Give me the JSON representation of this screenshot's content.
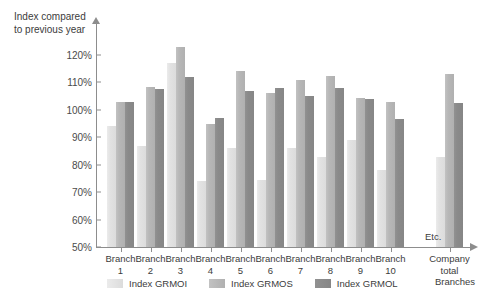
{
  "chart_data": {
    "type": "bar",
    "title": "Index compared to previous year",
    "xlabel": "Branches",
    "ylabel": "Index compared to previous year",
    "ylim": [
      50,
      125
    ],
    "yticks": [
      50,
      60,
      70,
      80,
      90,
      100,
      110,
      120
    ],
    "ytick_labels": [
      "50%",
      "60%",
      "70%",
      "80%",
      "90%",
      "100%",
      "110%",
      "120%"
    ],
    "grid": false,
    "legend_position": "bottom",
    "categories": [
      "Branch\n1",
      "Branch\n2",
      "Branch\n3",
      "Branch\n4",
      "Branch\n5",
      "Branch\n6",
      "Branch\n7",
      "Branch\n8",
      "Branch\n9",
      "Branch\n10",
      "Company\ntotal"
    ],
    "series": [
      {
        "name": "Index GRMOI",
        "color": "#e3e3e3",
        "values": [
          94,
          87,
          117,
          74,
          86,
          74.5,
          86,
          83,
          89,
          78,
          83
        ]
      },
      {
        "name": "Index GRMOS",
        "color": "#b8b8b8",
        "values": [
          103,
          108.5,
          123,
          95,
          114,
          106,
          111,
          112.5,
          104.5,
          103,
          113
        ]
      },
      {
        "name": "Index GRMOL",
        "color": "#8a8a8a",
        "values": [
          103,
          107.5,
          112,
          97,
          107,
          108,
          105,
          108,
          104,
          96.5,
          102.5
        ]
      }
    ],
    "annotations": [
      {
        "text": "Etc.",
        "near": "company-total-gap"
      }
    ]
  },
  "axis": {
    "title_line1": "Index compared",
    "title_line2": "to previous year",
    "title": "Index compared\nto previous year",
    "x_caption": "Branches"
  },
  "legend": {
    "items": [
      {
        "label": "Index GRMOI",
        "color": "#e3e3e3"
      },
      {
        "label": "Index GRMOS",
        "color": "#b8b8b8"
      },
      {
        "label": "Index GRMOL",
        "color": "#8a8a8a"
      }
    ]
  },
  "notes": {
    "etc": "Etc."
  }
}
